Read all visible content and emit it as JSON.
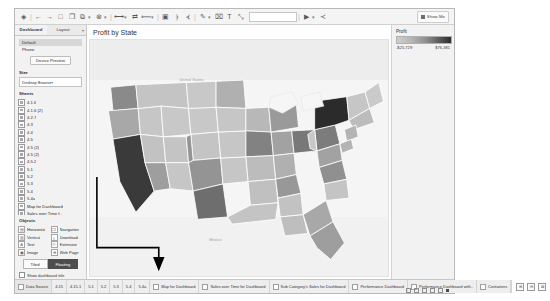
{
  "app": {
    "title": "Tableau Desktop",
    "show_me_label": "Show Me"
  },
  "toolbar": {
    "icons": [
      {
        "name": "tableau-logo-icon",
        "glyph": "◈"
      },
      {
        "name": "back-arrow-icon",
        "glyph": "←"
      },
      {
        "name": "forward-arrow-icon",
        "glyph": "→"
      },
      {
        "name": "save-icon",
        "glyph": "□"
      },
      {
        "name": "connect-data-icon",
        "glyph": "❐"
      },
      {
        "name": "new-worksheet-icon",
        "glyph": "⧉"
      },
      {
        "name": "new-dashboard-icon",
        "glyph": "▣"
      },
      {
        "name": "duplicate-icon",
        "glyph": "❐"
      },
      {
        "name": "clear-sheet-icon",
        "glyph": "⊗"
      },
      {
        "name": "undo-icon",
        "glyph": "↶"
      },
      {
        "name": "redo-icon",
        "glyph": "↷"
      },
      {
        "name": "swap-rows-columns-icon",
        "glyph": "⇄"
      },
      {
        "name": "sort-ascending-icon",
        "glyph": "⤒"
      },
      {
        "name": "sort-descending-icon",
        "glyph": "⤓"
      },
      {
        "name": "highlight-icon",
        "glyph": "✎"
      },
      {
        "name": "group-members-icon",
        "glyph": "⌗"
      },
      {
        "name": "show-labels-icon",
        "glyph": "T"
      },
      {
        "name": "fix-axes-icon",
        "glyph": "⤡"
      },
      {
        "name": "presentation-mode-icon",
        "glyph": "▶"
      },
      {
        "name": "share-icon",
        "glyph": "≺"
      }
    ],
    "fit_value": ""
  },
  "left_panel": {
    "tabs": [
      {
        "label": "Dashboard",
        "active": true
      },
      {
        "label": "Layout",
        "active": false
      }
    ],
    "device_section": {
      "header": "Default",
      "items": [
        {
          "label": "Default",
          "selected": true
        },
        {
          "label": "Phone",
          "selected": false
        }
      ],
      "device_preview_button": "Device Preview"
    },
    "size_section": {
      "header": "Size",
      "value": "Desktop Browser (1000 x 8..",
      "caret": "▾"
    },
    "sheets_section": {
      "header": "Sheets",
      "items": [
        {
          "label": "4.1.6"
        },
        {
          "label": "4.1.6 (2)"
        },
        {
          "label": "4.2.7"
        },
        {
          "label": "4.3"
        },
        {
          "label": "4.4"
        },
        {
          "label": "4.5"
        },
        {
          "label": "4.5 (2)"
        },
        {
          "label": "4.5 (2)"
        },
        {
          "label": "4.5.2"
        },
        {
          "label": "5.1"
        },
        {
          "label": "5.2"
        },
        {
          "label": "5.3"
        },
        {
          "label": "5.4"
        },
        {
          "label": "5.4a"
        },
        {
          "label": "Map for Dashboard"
        },
        {
          "label": "Sales over Time f.."
        },
        {
          "label": "Sub Category Sal.."
        }
      ]
    },
    "objects_section": {
      "header": "Objects",
      "items": [
        {
          "label": "Horizontal",
          "icon": "horizontal-container-icon",
          "glyph": "▤"
        },
        {
          "label": "Navigation",
          "icon": "navigation-icon",
          "glyph": "❐"
        },
        {
          "label": "Vertical",
          "icon": "vertical-container-icon",
          "glyph": "▥"
        },
        {
          "label": "Download",
          "icon": "download-icon",
          "glyph": "⤓"
        },
        {
          "label": "Text",
          "icon": "text-icon",
          "glyph": "A"
        },
        {
          "label": "Extension",
          "icon": "extension-icon",
          "glyph": "⚇"
        },
        {
          "label": "Image",
          "icon": "image-icon",
          "glyph": "▣"
        },
        {
          "label": "Web Page",
          "icon": "web-page-icon",
          "glyph": "⊕"
        }
      ]
    },
    "layout_toggle": {
      "tiled_label": "Tiled",
      "floating_label": "Floating",
      "active": "Floating"
    },
    "show_title_checkbox": {
      "label": "Show dashboard title",
      "checked": false
    }
  },
  "dashboard": {
    "title": "Profit by State",
    "map_labels": [
      {
        "text": "United States",
        "x": 28,
        "y": 20
      },
      {
        "text": "Mexico",
        "x": 40,
        "y": 83
      }
    ]
  },
  "legend": {
    "title": "Profit",
    "min_value": "-$25,729",
    "max_value": "$76,381",
    "gradient_from": "#cfcfcf",
    "gradient_to": "#2b2b2b"
  },
  "chart_data": {
    "type": "heatmap",
    "title": "Profit by State",
    "subtype": "choropleth-map",
    "measure": "Profit",
    "color_scale_min": -25729,
    "color_scale_max": 76381,
    "states": [
      {
        "name": "California",
        "value": 76381,
        "shade": "#3a3a3a"
      },
      {
        "name": "New York",
        "value": 74039,
        "shade": "#2b2b2b"
      },
      {
        "name": "Washington",
        "value": 33403,
        "shade": "#8a8a8a"
      },
      {
        "name": "Michigan",
        "value": 24463,
        "shade": "#9a9a9a"
      },
      {
        "name": "Virginia",
        "value": 18598,
        "shade": "#a2a2a2"
      },
      {
        "name": "Indiana",
        "value": 18382,
        "shade": "#a2a2a2"
      },
      {
        "name": "Georgia",
        "value": 16250,
        "shade": "#a8a8a8"
      },
      {
        "name": "Kentucky",
        "value": 11200,
        "shade": "#b0b0b0"
      },
      {
        "name": "Minnesota",
        "value": 10823,
        "shade": "#b0b0b0"
      },
      {
        "name": "Delaware",
        "value": 9977,
        "shade": "#b4b4b4"
      },
      {
        "name": "New Jersey",
        "value": 9772,
        "shade": "#b4b4b4"
      },
      {
        "name": "Wisconsin",
        "value": 8402,
        "shade": "#b8b8b8"
      },
      {
        "name": "Rhode Island",
        "value": 7286,
        "shade": "#bababa"
      },
      {
        "name": "Maryland",
        "value": 7031,
        "shade": "#bababa"
      },
      {
        "name": "Massachusetts",
        "value": 6785,
        "shade": "#bcbcbc"
      },
      {
        "name": "Missouri",
        "value": 6436,
        "shade": "#bcbcbc"
      },
      {
        "name": "Alabama",
        "value": 5786,
        "shade": "#bebebe"
      },
      {
        "name": "Oklahoma",
        "value": 4853,
        "shade": "#c0c0c0"
      },
      {
        "name": "Arkansas",
        "value": 4008,
        "shade": "#c0c0c0"
      },
      {
        "name": "Connecticut",
        "value": 3511,
        "shade": "#c2c2c2"
      },
      {
        "name": "Mississippi",
        "value": 3172,
        "shade": "#c2c2c2"
      },
      {
        "name": "South Carolina",
        "value": 1769,
        "shade": "#c4c4c4"
      },
      {
        "name": "Nevada",
        "value": 3316,
        "shade": "#c2c2c2"
      },
      {
        "name": "Utah",
        "value": 2547,
        "shade": "#c4c4c4"
      },
      {
        "name": "New Hampshire",
        "value": 1706,
        "shade": "#c4c4c4"
      },
      {
        "name": "Vermont",
        "value": 1013,
        "shade": "#c6c6c6"
      },
      {
        "name": "Maine",
        "value": -1646,
        "shade": "#cacaca"
      },
      {
        "name": "South Dakota",
        "value": 394,
        "shade": "#c6c6c6"
      },
      {
        "name": "Montana",
        "value": 1833,
        "shade": "#c4c4c4"
      },
      {
        "name": "West Virginia",
        "value": 186,
        "shade": "#c8c8c8"
      },
      {
        "name": "Nebraska",
        "value": 2037,
        "shade": "#c4c4c4"
      },
      {
        "name": "Idaho",
        "value": 826,
        "shade": "#c6c6c6"
      },
      {
        "name": "New Mexico",
        "value": 1157,
        "shade": "#c6c6c6"
      },
      {
        "name": "Louisiana",
        "value": 2196,
        "shade": "#c4c4c4"
      },
      {
        "name": "Iowa",
        "value": 1183,
        "shade": "#c6c6c6"
      },
      {
        "name": "Kansas",
        "value": 836,
        "shade": "#c6c6c6"
      },
      {
        "name": "Wyoming",
        "value": 100,
        "shade": "#c8c8c8"
      },
      {
        "name": "North Dakota",
        "value": 230,
        "shade": "#c8c8c8"
      },
      {
        "name": "Florida",
        "value": -3399,
        "shade": "#9e9e9e"
      },
      {
        "name": "Arizona",
        "value": -3428,
        "shade": "#9e9e9e"
      },
      {
        "name": "Tennessee",
        "value": -5342,
        "shade": "#989898"
      },
      {
        "name": "Colorado",
        "value": -6527,
        "shade": "#949494"
      },
      {
        "name": "North Carolina",
        "value": -7490,
        "shade": "#909090"
      },
      {
        "name": "Illinois",
        "value": -12607,
        "shade": "#828282"
      },
      {
        "name": "Pennsylvania",
        "value": -15559,
        "shade": "#7c7c7c"
      },
      {
        "name": "Ohio",
        "value": -16971,
        "shade": "#787878"
      },
      {
        "name": "Texas",
        "value": -25729,
        "shade": "#6e6e6e"
      },
      {
        "name": "Oregon",
        "value": -1190,
        "shade": "#a8a8a8"
      }
    ]
  },
  "tab_bar": {
    "data_source_tab": "Data Source",
    "sheet_tabs": [
      "4.15",
      "4.15.1",
      "5.1",
      "5.2",
      "5.3",
      "5.4",
      "5.4a",
      "Map for Dashboard",
      "Sales over Time for Dashboard",
      "Sub Category's Sales for Dashboard",
      "Performance Dashboard",
      "Performance Dashboard with..",
      "Containers"
    ],
    "right_icons": [
      {
        "name": "new-worksheet-icon",
        "glyph": "⊞"
      },
      {
        "name": "new-dashboard-icon",
        "glyph": "⊟"
      },
      {
        "name": "new-story-icon",
        "glyph": "⊠"
      }
    ]
  }
}
